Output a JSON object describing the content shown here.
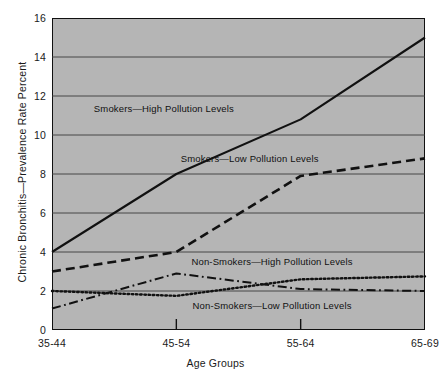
{
  "chart_data": {
    "type": "line",
    "title": "",
    "xlabel": "Age Groups",
    "ylabel": "Chronic Bronchitis—Prevalence Rate Percent",
    "categories": [
      "35-44",
      "45-54",
      "55-64",
      "65-69"
    ],
    "ylim": [
      0,
      16
    ],
    "yticks": [
      0,
      2,
      4,
      6,
      8,
      10,
      12,
      14,
      16
    ],
    "grid": true,
    "legend_position": "inline-annotations",
    "plot_background": "#b5b5b5",
    "line_color": "#111111",
    "series": [
      {
        "name": "Smokers—High Pollution Levels",
        "style": "solid",
        "values": [
          4.0,
          8.0,
          10.8,
          15.0
        ],
        "label_x_pct": 30,
        "label_y_pct": 29
      },
      {
        "name": "Smokers—Low Pollution Levels",
        "style": "dashed",
        "values": [
          3.0,
          4.0,
          7.9,
          8.8
        ],
        "label_x_pct": 53,
        "label_y_pct": 45
      },
      {
        "name": "Non-Smokers—High Pollution Levels",
        "style": "dotted",
        "values": [
          2.0,
          1.75,
          2.6,
          2.75
        ],
        "label_x_pct": 59,
        "label_y_pct": 78
      },
      {
        "name": "Non-Smokers—Low Pollution Levels",
        "style": "dash-dot",
        "values": [
          1.1,
          2.9,
          2.1,
          2.0
        ],
        "label_x_pct": 59,
        "label_y_pct": 92
      }
    ]
  },
  "axes": {
    "y_tick_labels": [
      "16",
      "14",
      "12",
      "10",
      "8",
      "6",
      "4",
      "2",
      "0"
    ],
    "x_tick_labels": [
      "35-44",
      "45-54",
      "55-64",
      "65-69"
    ],
    "y_title": "Chronic Bronchitis—Prevalence Rate Percent",
    "x_title": "Age Groups"
  },
  "annotations": {
    "smokers_high": "Smokers—High Pollution Levels",
    "smokers_low": "Smokers—Low Pollution Levels",
    "nonsmokers_high": "Non-Smokers—High Pollution Levels",
    "nonsmokers_low": "Non-Smokers—Low Pollution Levels"
  }
}
